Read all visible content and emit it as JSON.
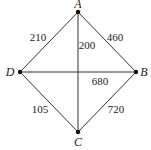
{
  "diagram": {
    "type": "weighted-graph",
    "nodes": [
      {
        "id": "A",
        "label": "A",
        "x": 78,
        "y": 12,
        "lx": 78,
        "ly": 4
      },
      {
        "id": "B",
        "label": "B",
        "x": 136,
        "y": 72,
        "lx": 144,
        "ly": 72
      },
      {
        "id": "C",
        "label": "C",
        "x": 78,
        "y": 132,
        "lx": 78,
        "ly": 142
      },
      {
        "id": "D",
        "label": "D",
        "x": 20,
        "y": 72,
        "lx": 10,
        "ly": 72
      }
    ],
    "edges": [
      {
        "from": "A",
        "to": "D",
        "weight": "210",
        "lx": 38,
        "ly": 37
      },
      {
        "from": "A",
        "to": "B",
        "weight": "460",
        "lx": 115,
        "ly": 37
      },
      {
        "from": "A",
        "to": "C",
        "weight": "200",
        "lx": 87,
        "ly": 45
      },
      {
        "from": "D",
        "to": "B",
        "weight": "680",
        "lx": 100,
        "ly": 81
      },
      {
        "from": "D",
        "to": "C",
        "weight": "105",
        "lx": 40,
        "ly": 109
      },
      {
        "from": "B",
        "to": "C",
        "weight": "720",
        "lx": 116,
        "ly": 109
      }
    ],
    "colors": {
      "line": "#333333",
      "node": "#111111",
      "text": "#222222"
    }
  }
}
